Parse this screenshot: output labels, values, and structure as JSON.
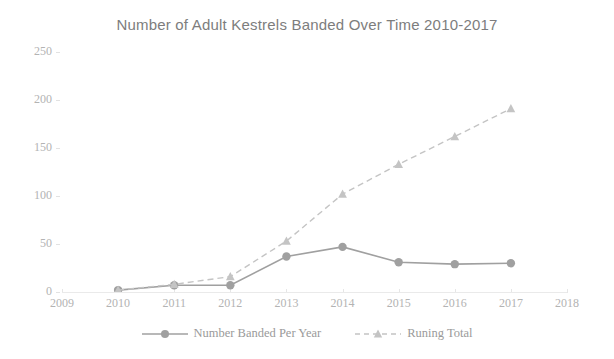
{
  "chart_data": {
    "type": "line",
    "title": "Number of Adult Kestrels Banded Over Time 2010-2017",
    "xlabel": "",
    "ylabel": "",
    "x": [
      2010,
      2011,
      2012,
      2013,
      2014,
      2015,
      2016,
      2017
    ],
    "xlim": [
      2009,
      2018
    ],
    "ylim": [
      0,
      250
    ],
    "x_tick_labels": [
      "2009",
      "2010",
      "2011",
      "2012",
      "2013",
      "2014",
      "2015",
      "2016",
      "2017",
      "2018"
    ],
    "y_tick_labels": [
      "0",
      "50",
      "100",
      "150",
      "200",
      "250"
    ],
    "y_ticks": [
      0,
      50,
      100,
      150,
      200,
      250
    ],
    "grid": false,
    "legend_position": "bottom",
    "series": [
      {
        "name": "Number Banded Per Year",
        "marker": "circle",
        "linestyle": "solid",
        "color": "#a0a0a0",
        "values": [
          2,
          7,
          7,
          37,
          47,
          31,
          29,
          30
        ]
      },
      {
        "name": "Runing Total",
        "marker": "triangle",
        "linestyle": "dashed",
        "color": "#c4c4c4",
        "values": [
          2,
          8,
          16,
          53,
          102,
          133,
          162,
          191
        ]
      }
    ]
  },
  "colors": {
    "title": "#7d7d7d",
    "tick_label": "#b3b3b3",
    "legend_label": "#9a9a9a",
    "axis_line": "#eaeaea",
    "background": "#ffffff"
  }
}
